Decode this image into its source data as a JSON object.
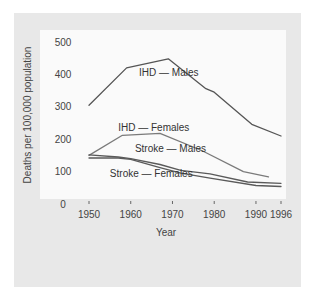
{
  "chart_data": {
    "type": "line",
    "title": "",
    "xlabel": "Year",
    "ylabel": "Deaths per 100,000 population",
    "xlim": [
      1950,
      1996
    ],
    "ylim": [
      0,
      500
    ],
    "x_ticks": [
      1950,
      1960,
      1970,
      1980,
      1990,
      1996
    ],
    "y_ticks": [
      0,
      100,
      200,
      300,
      400,
      500
    ],
    "grid": false,
    "legend": "inline labels",
    "series": [
      {
        "name": "IHD — Males",
        "color": "#555555",
        "points": [
          [
            1950,
            305
          ],
          [
            1959,
            420
          ],
          [
            1969,
            448
          ],
          [
            1978,
            356
          ],
          [
            1980,
            345
          ],
          [
            1989,
            246
          ],
          [
            1996,
            210
          ]
        ],
        "label_pos": [
          1962,
          395
        ]
      },
      {
        "name": "IHD — Females",
        "color": "#7a7a7a",
        "points": [
          [
            1950,
            150
          ],
          [
            1958,
            212
          ],
          [
            1967,
            218
          ],
          [
            1977,
            165
          ],
          [
            1987,
            100
          ],
          [
            1993,
            84
          ]
        ],
        "label_pos": [
          1957,
          225
        ]
      },
      {
        "name": "Stroke — Males",
        "color": "#5a5a5a",
        "points": [
          [
            1950,
            152
          ],
          [
            1957,
            145
          ],
          [
            1960,
            140
          ],
          [
            1967,
            122
          ],
          [
            1972,
            104
          ],
          [
            1979,
            93
          ],
          [
            1988,
            68
          ],
          [
            1996,
            64
          ]
        ],
        "label_pos": [
          1961,
          162
        ]
      },
      {
        "name": "Stroke — Females",
        "color": "#5a5a5a",
        "points": [
          [
            1950,
            142
          ],
          [
            1957,
            142
          ],
          [
            1960,
            138
          ],
          [
            1967,
            112
          ],
          [
            1972,
            95
          ],
          [
            1979,
            80
          ],
          [
            1990,
            57
          ],
          [
            1996,
            54
          ]
        ],
        "label_pos": [
          1955,
          82
        ]
      }
    ]
  }
}
